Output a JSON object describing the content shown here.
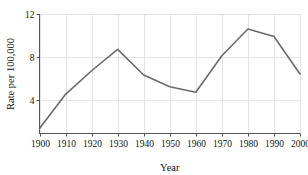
{
  "figure": {
    "background_color": "#ffffff",
    "cropped_title": "",
    "line_color": "#6a6a6a",
    "grid_color": "#e3e3e3",
    "axis_color": "#555555",
    "text_color": "#111111"
  },
  "chart_data": {
    "type": "line",
    "title": "",
    "xlabel": "Year",
    "ylabel": "Rate per 100,000",
    "x": [
      1900,
      1910,
      1920,
      1930,
      1940,
      1950,
      1960,
      1970,
      1980,
      1990,
      2000
    ],
    "values": [
      1.3,
      4.5,
      6.7,
      8.7,
      6.3,
      5.2,
      4.7,
      8.1,
      10.6,
      9.9,
      6.4
    ],
    "xtick_labels": [
      "1900",
      "1910",
      "1920",
      "1930",
      "1940",
      "1950",
      "1960",
      "1970",
      "1980",
      "1990",
      "2000"
    ],
    "ytick_labels": [
      "4",
      "8",
      "12"
    ],
    "ytick_values": [
      4,
      8,
      12
    ],
    "xlim": [
      1900,
      2000
    ],
    "ylim": [
      0.84,
      12
    ],
    "grid": true,
    "grid_axis": "both",
    "legend": false,
    "legend_position": "none",
    "marker": "none",
    "line_width": 1.6
  }
}
